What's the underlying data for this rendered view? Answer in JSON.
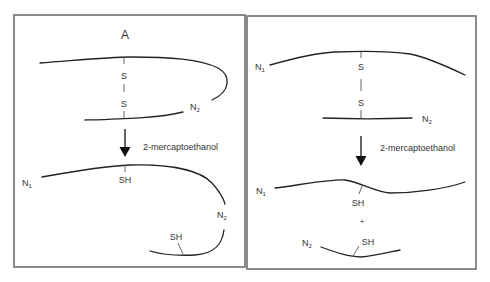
{
  "figure": {
    "colors": {
      "line": "#222222",
      "text": "#333333",
      "border": "#6f6f6f",
      "background": "#ffffff"
    }
  },
  "panel_left": {
    "title": "A",
    "before": {
      "sulfur_top": "S",
      "sulfur_bottom": "S",
      "n_terminus_label": "N",
      "n_terminus_sub": "2"
    },
    "reagent": "2-mercaptoethanol",
    "after": {
      "n1_label": "N",
      "n1_sub": "1",
      "thiol_1": "SH",
      "n2_label": "N",
      "n2_sub": "2",
      "thiol_2": "SH"
    }
  },
  "panel_right": {
    "before": {
      "n1_label": "N",
      "n1_sub": "1",
      "sulfur_top": "S",
      "sulfur_bottom": "S",
      "n2_label": "N",
      "n2_sub": "2"
    },
    "reagent": "2-mercaptoethanol",
    "after": {
      "n1_label": "N",
      "n1_sub": "1",
      "thiol_1": "SH",
      "plus": "+",
      "n2_label": "N",
      "n2_sub": "2",
      "thiol_2": "SH"
    }
  }
}
